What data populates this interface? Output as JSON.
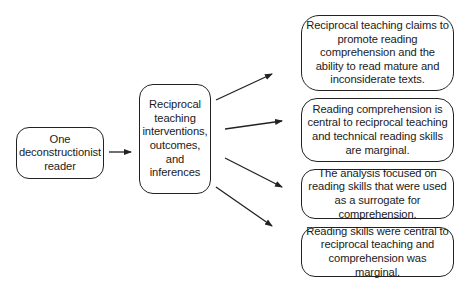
{
  "diagram": {
    "source": {
      "label": "One deconstructionist reader"
    },
    "middle": {
      "label": "Reciprocal teaching interventions, outcomes, and inferences"
    },
    "outcomes": [
      {
        "label": "Reciprocal teaching claims to promote reading comprehension and the ability to read mature and inconsiderate texts."
      },
      {
        "label": "Reading comprehension is central to reciprocal teaching and technical reading skills are marginal."
      },
      {
        "label": "The analysis focused on reading skills that were used as a surrogate for comprehension."
      },
      {
        "label": "Reading skills were central to reciprocal teaching and comprehension was marginal."
      }
    ],
    "edges": [
      {
        "from": "source",
        "to": "middle"
      },
      {
        "from": "middle",
        "to": "outcome-1"
      },
      {
        "from": "middle",
        "to": "outcome-2"
      },
      {
        "from": "middle",
        "to": "outcome-3"
      },
      {
        "from": "middle",
        "to": "outcome-4"
      }
    ],
    "colors": {
      "stroke": "#222222",
      "background": "#ffffff",
      "text": "#1a1a1a"
    }
  }
}
